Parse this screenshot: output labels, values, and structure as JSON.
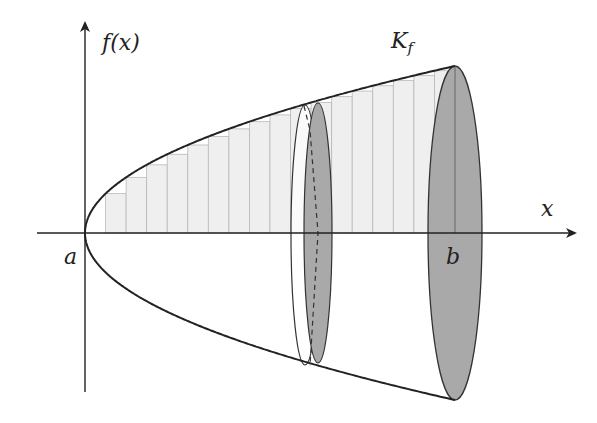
{
  "labels": {
    "y_axis": "f(x)",
    "x_axis": "x",
    "a": "a",
    "b": "b",
    "solid": "K",
    "solid_sub": "f"
  },
  "colors": {
    "bar_fill": "#efefef",
    "bar_stroke": "#b8b8b8",
    "disk_fill": "#a9a9a9",
    "line": "#222222"
  },
  "geometry": {
    "origin": [
      85,
      233
    ],
    "b_x": 455,
    "max_radius": 167,
    "bars": 18
  }
}
